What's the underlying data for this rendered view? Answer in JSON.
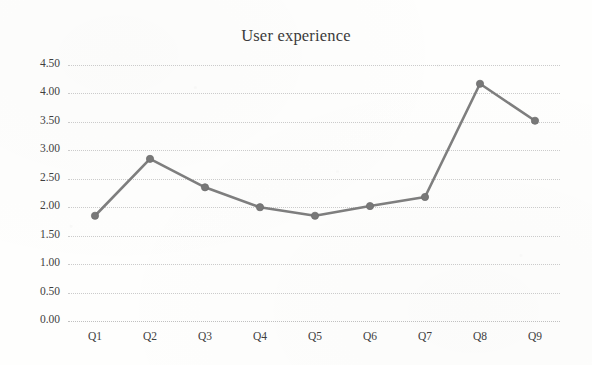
{
  "chart_data": {
    "type": "line",
    "title": "User experience",
    "xlabel": "",
    "ylabel": "",
    "categories": [
      "Q1",
      "Q2",
      "Q3",
      "Q4",
      "Q5",
      "Q6",
      "Q7",
      "Q8",
      "Q9"
    ],
    "values": [
      1.85,
      2.85,
      2.35,
      2.0,
      1.85,
      2.02,
      2.18,
      4.17,
      3.52
    ],
    "series": [
      {
        "name": "User experience",
        "values": [
          1.85,
          2.85,
          2.35,
          2.0,
          1.85,
          2.02,
          2.18,
          4.17,
          3.52
        ]
      }
    ],
    "ylim": [
      0.0,
      4.5
    ],
    "ytick_step": 0.5,
    "ytick_labels": [
      "4.50",
      "4.00",
      "3.50",
      "3.00",
      "2.50",
      "2.00",
      "1.50",
      "1.00",
      "0.50",
      "0.00"
    ],
    "ytick_values": [
      4.5,
      4.0,
      3.5,
      3.0,
      2.5,
      2.0,
      1.5,
      1.0,
      0.5,
      0.0
    ],
    "grid": true,
    "grid_style": "dotted",
    "legend": false,
    "legend_position": "none",
    "marker": "circle",
    "colors": {
      "line": "#7e7e7e",
      "marker": "#787878",
      "gridline": "#c9c9c9",
      "text": "#3f3f3f",
      "title": "#3b3b3b",
      "background": "#fefefd"
    }
  }
}
